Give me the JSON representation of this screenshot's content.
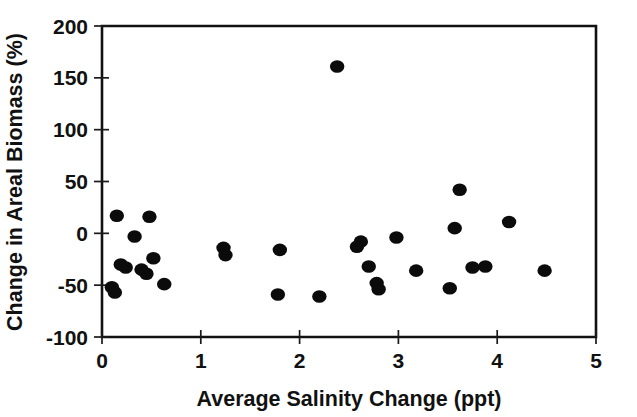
{
  "chart_data": {
    "type": "scatter",
    "title": "",
    "xlabel": "Average Salinity Change (ppt)",
    "ylabel": "Change in Areal Biomass (%)",
    "xlim": [
      0,
      5
    ],
    "ylim": [
      -100,
      200
    ],
    "xticks": [
      0,
      1,
      2,
      3,
      4,
      5
    ],
    "yticks": [
      -100,
      -50,
      0,
      50,
      100,
      150,
      200
    ],
    "xtick_labels": [
      "0",
      "1",
      "2",
      "3",
      "4",
      "5"
    ],
    "ytick_labels": [
      "-100",
      "-50",
      "0",
      "50",
      "100",
      "150",
      "200"
    ],
    "grid": false,
    "legend": null,
    "marker": "filled-circle",
    "marker_color": "#0b0b0b",
    "series": [
      {
        "name": "sites",
        "points": [
          [
            0.1,
            -52
          ],
          [
            0.13,
            -57
          ],
          [
            0.15,
            17
          ],
          [
            0.19,
            -30
          ],
          [
            0.24,
            -33
          ],
          [
            0.33,
            -3
          ],
          [
            0.4,
            -35
          ],
          [
            0.45,
            -39
          ],
          [
            0.48,
            16
          ],
          [
            0.52,
            -24
          ],
          [
            0.63,
            -49
          ],
          [
            1.23,
            -14
          ],
          [
            1.25,
            -21
          ],
          [
            1.78,
            -59
          ],
          [
            1.8,
            -16
          ],
          [
            2.2,
            -61
          ],
          [
            2.38,
            161
          ],
          [
            2.58,
            -13
          ],
          [
            2.62,
            -8
          ],
          [
            2.7,
            -32
          ],
          [
            2.78,
            -48
          ],
          [
            2.8,
            -54
          ],
          [
            2.98,
            -4
          ],
          [
            3.18,
            -36
          ],
          [
            3.52,
            -53
          ],
          [
            3.57,
            5
          ],
          [
            3.62,
            42
          ],
          [
            3.75,
            -33
          ],
          [
            3.88,
            -32
          ],
          [
            4.12,
            11
          ],
          [
            4.48,
            -36
          ]
        ]
      }
    ]
  },
  "axes": {
    "x_axis_label": "Average Salinity Change (ppt)",
    "y_axis_label": "Change in Areal Biomass (%)"
  }
}
